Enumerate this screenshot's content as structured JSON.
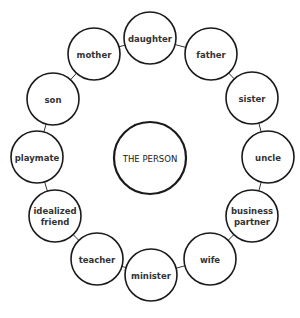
{
  "center": {
    "label": "THE PERSON",
    "x": 150,
    "y": 158,
    "r": 36
  },
  "node_radius": 26,
  "nodes": [
    {
      "id": "daughter",
      "lines": [
        "daughter"
      ],
      "x": 150,
      "y": 38
    },
    {
      "id": "father",
      "lines": [
        "father"
      ],
      "x": 211,
      "y": 54
    },
    {
      "id": "sister",
      "lines": [
        "sister"
      ],
      "x": 252,
      "y": 98
    },
    {
      "id": "uncle",
      "lines": [
        "uncle"
      ],
      "x": 268,
      "y": 157
    },
    {
      "id": "business-partner",
      "lines": [
        "business",
        "partner"
      ],
      "x": 252,
      "y": 216
    },
    {
      "id": "wife",
      "lines": [
        "wife"
      ],
      "x": 210,
      "y": 259
    },
    {
      "id": "minister",
      "lines": [
        "minister"
      ],
      "x": 151,
      "y": 275
    },
    {
      "id": "teacher",
      "lines": [
        "teacher"
      ],
      "x": 97,
      "y": 259
    },
    {
      "id": "idealized-friend",
      "lines": [
        "idealized",
        "friend"
      ],
      "x": 55,
      "y": 216
    },
    {
      "id": "playmate",
      "lines": [
        "playmate"
      ],
      "x": 37,
      "y": 157
    },
    {
      "id": "son",
      "lines": [
        "son"
      ],
      "x": 53,
      "y": 99
    },
    {
      "id": "mother",
      "lines": [
        "mother"
      ],
      "x": 94,
      "y": 54
    }
  ]
}
